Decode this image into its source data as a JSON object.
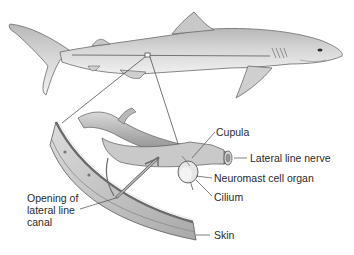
{
  "figure": {
    "colors": {
      "body_light": "#e6e6e6",
      "body_mid": "#c4c4c4",
      "body_dark": "#8f8f8f",
      "outline": "#5a5a5a",
      "label_text": "#2a2a2a",
      "leader_line": "#4a4a4a",
      "background": "#ffffff"
    }
  },
  "labels": {
    "cupula": "Cupula",
    "lateral_line_nerve": "Lateral line nerve",
    "neuromast": "Neuromast cell organ",
    "cilium": "Cilium",
    "opening_line1": "Opening of",
    "opening_line2": "lateral line",
    "opening_line3": "canal",
    "skin": "Skin"
  }
}
